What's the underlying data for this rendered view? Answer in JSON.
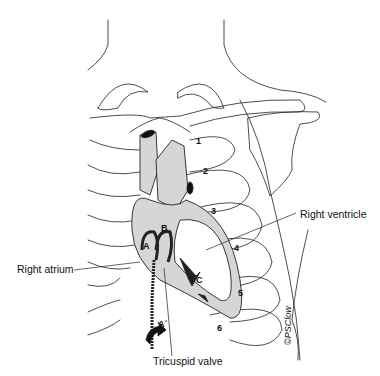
{
  "figure": {
    "labels": {
      "right_ventricle": "Right ventricle",
      "right_atrium": "Right atrium",
      "tricuspid_valve": "Tricuspid valve"
    },
    "rib_numbers": [
      "1",
      "2",
      "3",
      "4",
      "5",
      "6"
    ],
    "markers": {
      "a": "A",
      "b": "B",
      "c": "C",
      "a_prime": "A´"
    },
    "signature": "©PSClow"
  }
}
